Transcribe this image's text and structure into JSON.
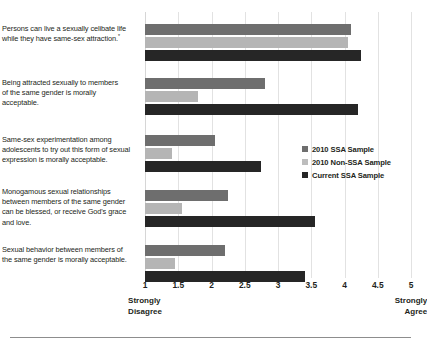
{
  "chart_data": {
    "type": "bar",
    "orientation": "horizontal",
    "title": "",
    "xlabel": "",
    "ylabel": "",
    "xlim": [
      1,
      5
    ],
    "xticks": [
      "1",
      "1.5",
      "2",
      "2.5",
      "3",
      "3.5",
      "4",
      "4.5",
      "5"
    ],
    "xtick_values": [
      1,
      1.5,
      2,
      2.5,
      3,
      3.5,
      4,
      4.5,
      5
    ],
    "axis_low_label": "Strongly\nDisagree",
    "axis_low_label_line1": "Strongly",
    "axis_low_label_line2": "Disagree",
    "axis_high_label_line1": "Strongly",
    "axis_high_label_line2": "Agree",
    "grid": true,
    "legend_position": "middle-right",
    "categories": [
      "Persons can live a sexually celibate life while they have same-sex attraction.",
      "Being attracted sexually to members of the same gender is morally acceptable.",
      "Same-sex experimentation among adolescents to try out this form of sexual expression is morally acceptable.",
      "Monogamous sexual relationships between members of the same gender can be blessed, or receive God's grace and love.",
      "Sexual behavior between members of the same gender is morally acceptable."
    ],
    "category_footnotes": [
      "*",
      "",
      "",
      "",
      ""
    ],
    "series": [
      {
        "name": "2010 SSA Sample",
        "color": "#6e6e6e",
        "values": [
          4.1,
          2.8,
          2.05,
          2.25,
          2.2
        ]
      },
      {
        "name": "2010 Non-SSA Sample",
        "color": "#b5b5b5",
        "values": [
          4.05,
          1.8,
          1.4,
          1.55,
          1.45
        ]
      },
      {
        "name": "Current SSA Sample",
        "color": "#262626",
        "values": [
          4.25,
          4.2,
          2.75,
          3.55,
          3.4
        ]
      }
    ]
  },
  "legend": {
    "items": [
      {
        "label": "2010 SSA Sample"
      },
      {
        "label": "2010 Non-SSA Sample"
      },
      {
        "label": "Current SSA Sample"
      }
    ]
  },
  "labels": {
    "cat0_line1": "Persons can live a sexually celibate life",
    "cat0_line2": "while they have same-sex attraction.",
    "cat0_footnote": "*",
    "cat1_line1": "Being attracted sexually to members",
    "cat1_line2": "of the same gender is morally",
    "cat1_line3": "acceptable.",
    "cat2_line1": "Same-sex experimentation among",
    "cat2_line2": "adolescents to try out this form of sexual",
    "cat2_line3": "expression is morally acceptable.",
    "cat3_line1": "Monogamous sexual relationships",
    "cat3_line2": "between members of the same gender",
    "cat3_line3": "can be blessed, or receive God's grace",
    "cat3_line4": "and love.",
    "cat4_line1": "Sexual behavior between members of",
    "cat4_line2": "the same gender is morally acceptable."
  },
  "axis": {
    "t0": "1",
    "t1": "1.5",
    "t2": "2",
    "t3": "2.5",
    "t4": "3",
    "t5": "3.5",
    "t6": "4",
    "t7": "4.5",
    "t8": "5",
    "low1": "Strongly",
    "low2": "Disagree",
    "high1": "Strongly",
    "high2": "Agree"
  }
}
